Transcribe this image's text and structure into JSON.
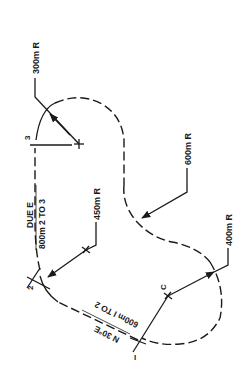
{
  "diagram": {
    "type": "road-curve-alignment",
    "points": [
      {
        "id": "1",
        "label": "I"
      },
      {
        "id": "2",
        "label": "2"
      },
      {
        "id": "3",
        "label": "3"
      },
      {
        "id": "C",
        "label": "C"
      }
    ],
    "curve_labels": {
      "r300": "300m R",
      "r600": "600m R",
      "r450": "450m R",
      "r400": "400m R"
    },
    "tangents": {
      "t23_bearing": "DUE  E",
      "t23_length": "800m  2  TO  3",
      "t12_bearing": "N 30°E",
      "t12_length": "600m  I  TO 2"
    }
  }
}
